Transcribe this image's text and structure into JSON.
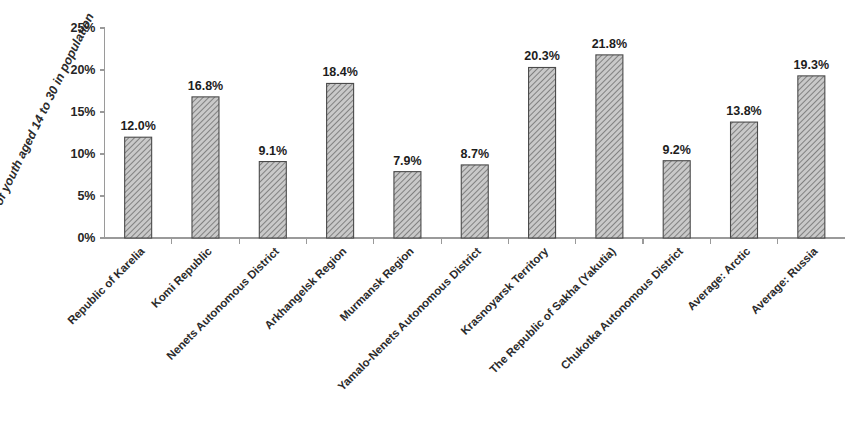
{
  "chart_data": {
    "type": "bar",
    "title": "",
    "subtitle": "",
    "xlabel": "",
    "ylabel": "Proportion of youth aged 14 to 30 in population",
    "ylim": [
      0,
      25
    ],
    "ytick_values": [
      0,
      5,
      10,
      15,
      20,
      25
    ],
    "ytick_labels": [
      "0%",
      "5%",
      "10%",
      "15%",
      "20%",
      "25%"
    ],
    "grid": false,
    "legend": false,
    "legend_position": "none",
    "bar_fill_color": "#b3b3b3",
    "bar_edge_color": "#4a4a4a",
    "bar_hatch": "diagonal-crosshatch",
    "axis_color": "#9a9a9a",
    "background_color": "#ffffff",
    "categories": [
      "Republic of Karelia",
      "Komi Republic",
      "Nenets Autonomous District",
      "Arkhangelsk Region",
      "Murmansk Region",
      "Yamalo-Nenets Autonomous District",
      "Krasnoyarsk Territory",
      "The Republic of Sakha (Yakutia)",
      "Chukotka Autonomous District",
      "Average: Arctic",
      "Average: Russia"
    ],
    "values": [
      12.0,
      16.8,
      9.1,
      18.4,
      7.9,
      8.7,
      20.3,
      21.8,
      9.2,
      13.8,
      19.3
    ],
    "data_labels": [
      "12.0%",
      "16.8%",
      "9.1%",
      "18.4%",
      "7.9%",
      "8.7%",
      "20.3%",
      "21.8%",
      "9.2%",
      "13.8%",
      "19.3%"
    ]
  }
}
